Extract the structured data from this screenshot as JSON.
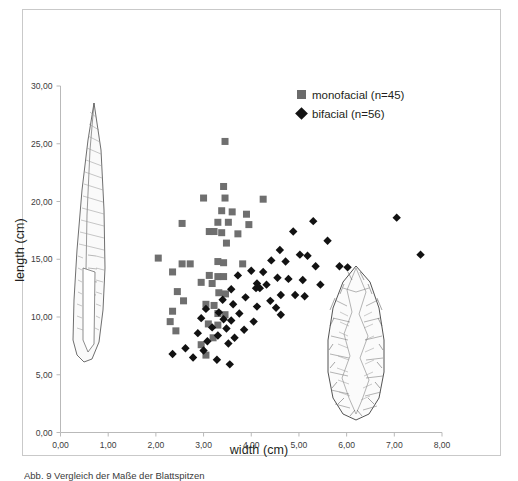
{
  "figure": {
    "caption": "Abb. 9  Vergleich der Maße der Blattspitzen"
  },
  "legend": {
    "position": "top-right",
    "entries": [
      {
        "label": "monofacial (n=45)",
        "marker": "square-marker-icon",
        "color": "#6b6b6b"
      },
      {
        "label": "bifacial (n=56)",
        "marker": "diamond-marker-icon",
        "color": "#131313"
      }
    ]
  },
  "artifacts": [
    {
      "name": "monofacial-blade-drawing",
      "description": "long slender unifacial blade point"
    },
    {
      "name": "bifacial-leaf-point-drawing",
      "description": "leaf-shaped bifacial point"
    }
  ],
  "chart_data": {
    "type": "scatter",
    "title": "",
    "xlabel": "width (cm)",
    "ylabel": "length (cm)",
    "xlim": [
      0,
      8
    ],
    "ylim": [
      0,
      30
    ],
    "xticks": [
      0,
      1,
      2,
      3,
      4,
      5,
      6,
      7,
      8
    ],
    "yticks": [
      0,
      5,
      10,
      15,
      20,
      25,
      30
    ],
    "xtick_labels": [
      "0,00",
      "1,00",
      "2,00",
      "3,00",
      "4,00",
      "5,00",
      "6,00",
      "7,00",
      "8,00"
    ],
    "ytick_labels": [
      "0,00",
      "5,00",
      "10,00",
      "15,00",
      "20,00",
      "25,00",
      "30,00"
    ],
    "grid": false,
    "series": [
      {
        "name": "monofacial (n=45)",
        "marker": "square",
        "color": "#6f6f6f",
        "count": 45,
        "points": [
          [
            3.45,
            25.2
          ],
          [
            3.42,
            21.3
          ],
          [
            3.0,
            20.3
          ],
          [
            3.45,
            20.3
          ],
          [
            4.25,
            20.2
          ],
          [
            3.38,
            19.2
          ],
          [
            3.6,
            19.1
          ],
          [
            3.9,
            18.9
          ],
          [
            3.3,
            18.2
          ],
          [
            3.52,
            18.2
          ],
          [
            3.95,
            18.0
          ],
          [
            2.55,
            18.1
          ],
          [
            3.12,
            17.4
          ],
          [
            3.22,
            17.4
          ],
          [
            3.38,
            17.3
          ],
          [
            3.72,
            17.2
          ],
          [
            3.48,
            16.4
          ],
          [
            2.05,
            15.1
          ],
          [
            2.55,
            14.6
          ],
          [
            2.72,
            14.6
          ],
          [
            3.3,
            14.8
          ],
          [
            3.42,
            14.7
          ],
          [
            3.82,
            14.6
          ],
          [
            2.35,
            13.9
          ],
          [
            3.12,
            13.6
          ],
          [
            3.3,
            13.5
          ],
          [
            3.42,
            13.5
          ],
          [
            2.95,
            13.0
          ],
          [
            3.18,
            12.9
          ],
          [
            2.45,
            12.2
          ],
          [
            3.32,
            12.1
          ],
          [
            3.46,
            12.0
          ],
          [
            2.58,
            11.4
          ],
          [
            3.05,
            11.1
          ],
          [
            3.22,
            11.0
          ],
          [
            2.35,
            10.5
          ],
          [
            3.3,
            10.3
          ],
          [
            3.45,
            10.2
          ],
          [
            2.3,
            9.6
          ],
          [
            3.1,
            9.4
          ],
          [
            3.3,
            9.3
          ],
          [
            2.42,
            8.8
          ],
          [
            3.2,
            8.2
          ],
          [
            2.95,
            7.6
          ],
          [
            3.05,
            6.7
          ]
        ]
      },
      {
        "name": "bifacial (n=56)",
        "marker": "diamond",
        "color": "#121212",
        "count": 56,
        "points": [
          [
            7.05,
            18.6
          ],
          [
            5.3,
            18.3
          ],
          [
            7.55,
            15.4
          ],
          [
            4.88,
            17.4
          ],
          [
            5.6,
            16.6
          ],
          [
            4.6,
            15.8
          ],
          [
            5.02,
            15.4
          ],
          [
            5.18,
            15.3
          ],
          [
            4.42,
            14.9
          ],
          [
            4.72,
            14.8
          ],
          [
            5.35,
            14.4
          ],
          [
            5.85,
            14.4
          ],
          [
            6.02,
            14.3
          ],
          [
            4.0,
            14.0
          ],
          [
            4.25,
            13.9
          ],
          [
            4.55,
            13.4
          ],
          [
            4.78,
            13.3
          ],
          [
            5.08,
            13.2
          ],
          [
            3.72,
            13.6
          ],
          [
            4.12,
            12.9
          ],
          [
            4.32,
            12.8
          ],
          [
            4.1,
            12.5
          ],
          [
            4.18,
            12.5
          ],
          [
            5.45,
            12.8
          ],
          [
            3.58,
            12.4
          ],
          [
            4.62,
            11.9
          ],
          [
            4.92,
            11.9
          ],
          [
            5.12,
            11.8
          ],
          [
            3.88,
            11.7
          ],
          [
            4.4,
            11.4
          ],
          [
            3.4,
            11.5
          ],
          [
            3.62,
            11.1
          ],
          [
            4.12,
            10.9
          ],
          [
            4.52,
            10.8
          ],
          [
            3.05,
            10.7
          ],
          [
            3.32,
            10.4
          ],
          [
            3.75,
            10.3
          ],
          [
            4.62,
            10.2
          ],
          [
            2.95,
            9.9
          ],
          [
            3.42,
            9.8
          ],
          [
            3.58,
            9.7
          ],
          [
            4.05,
            9.6
          ],
          [
            3.18,
            9.1
          ],
          [
            3.48,
            9.0
          ],
          [
            3.85,
            8.9
          ],
          [
            2.88,
            8.6
          ],
          [
            3.3,
            8.4
          ],
          [
            3.65,
            8.2
          ],
          [
            3.08,
            7.9
          ],
          [
            3.52,
            7.7
          ],
          [
            2.62,
            7.3
          ],
          [
            3.0,
            7.1
          ],
          [
            2.35,
            6.8
          ],
          [
            2.78,
            6.5
          ],
          [
            3.28,
            6.3
          ],
          [
            3.55,
            5.9
          ]
        ]
      }
    ]
  }
}
